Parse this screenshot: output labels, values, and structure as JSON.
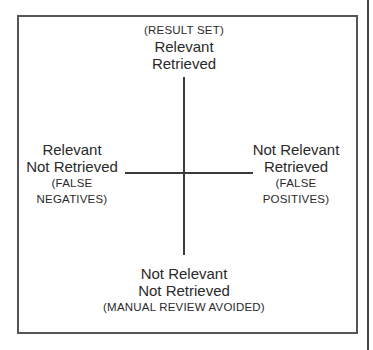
{
  "diagram": {
    "type": "quadrant",
    "quadrants": {
      "top": {
        "note": "(RESULT SET)",
        "line1": "Relevant",
        "line2": "Retrieved"
      },
      "left": {
        "line1": "Relevant",
        "line2": "Not Retrieved",
        "note1": "(FALSE",
        "note2": "NEGATIVES)"
      },
      "right": {
        "line1": "Not Relevant",
        "line2": "Retrieved",
        "note1": "(FALSE",
        "note2": "POSITIVES)"
      },
      "bottom": {
        "line1": "Not Relevant",
        "line2": "Not Retrieved",
        "note": "(MANUAL REVIEW AVOIDED)"
      }
    },
    "colors": {
      "border": "#555555",
      "lines": "#3a3a3a",
      "text": "#2a2a2a",
      "background": "#ffffff"
    }
  }
}
